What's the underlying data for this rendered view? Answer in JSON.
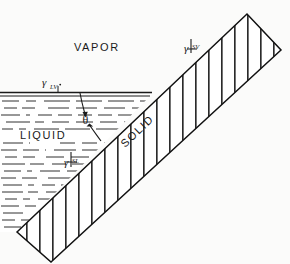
{
  "figure": {
    "phases": {
      "vapor": "VAPOR",
      "liquid": "LIQUID",
      "solid": "SOLID"
    },
    "angle_symbol": "θ",
    "tensions": {
      "liquid_vapor": {
        "symbol": "γ",
        "subscript": "LV",
        "full": "γLV"
      },
      "solid_vapor": {
        "symbol": "γ",
        "subscript": "SV",
        "full": "γSV"
      },
      "solid_liquid": {
        "symbol": "γ",
        "subscript": "SL",
        "full": "γSL"
      }
    },
    "colors": {
      "ink": "#1a1a1a",
      "background": "#fbfbfa",
      "hatch": "#2a2a2a"
    }
  }
}
